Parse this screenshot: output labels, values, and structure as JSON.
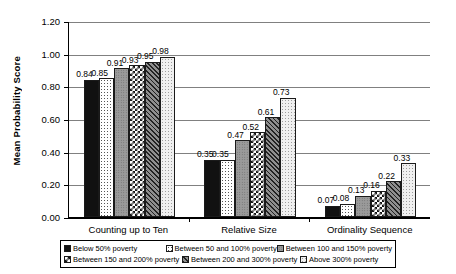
{
  "chart_data": {
    "type": "bar",
    "title": "",
    "xlabel": "",
    "ylabel": "Mean Probability Score",
    "ylim": [
      0.0,
      1.2
    ],
    "ytick_labels": [
      "0.00",
      "0.20",
      "0.40",
      "0.60",
      "0.80",
      "1.00",
      "1.20"
    ],
    "ytick_values": [
      0.0,
      0.2,
      0.4,
      0.6,
      0.8,
      1.0,
      1.2
    ],
    "grid": true,
    "legend_position": "bottom",
    "categories": [
      "Counting up to Ten",
      "Relative Size",
      "Ordinality Sequence"
    ],
    "series": [
      {
        "name": "Below 50% poverty",
        "pattern": "solid-black",
        "values": [
          0.84,
          0.35,
          0.07
        ],
        "labels": [
          "0.84",
          "0.35",
          "0.07"
        ]
      },
      {
        "name": "Between 50 and 100% poverty",
        "pattern": "light-dots",
        "values": [
          0.85,
          0.35,
          0.08
        ],
        "labels": [
          "0.85",
          "0.35",
          "0.08"
        ]
      },
      {
        "name": "Between 100 and 150% poverty",
        "pattern": "gray-dots",
        "values": [
          0.91,
          0.47,
          0.13
        ],
        "labels": [
          "0.91",
          "0.47",
          "0.13"
        ]
      },
      {
        "name": "Between 150 and 200% poverty",
        "pattern": "checkerboard",
        "values": [
          0.93,
          0.52,
          0.16
        ],
        "labels": [
          "0.93",
          "0.52",
          "0.16"
        ]
      },
      {
        "name": "Between 200 and 300% poverty",
        "pattern": "diagonal-hatch",
        "values": [
          0.95,
          0.61,
          0.22
        ],
        "labels": [
          "0.95",
          "0.61",
          "0.22"
        ]
      },
      {
        "name": "Above 300% poverty",
        "pattern": "pale-dots",
        "values": [
          0.98,
          0.73,
          0.33
        ],
        "labels": [
          "0.98",
          "0.73",
          "0.33"
        ]
      }
    ]
  },
  "axis": {
    "y_title": "Mean Probability Score"
  },
  "legend": {
    "items": [
      "Below 50% poverty",
      "Between 50 and 100% poverty",
      "Between 100 and 150% poverty",
      "Between 150 and 200% poverty",
      "Between 200 and 300% poverty",
      "Above 300% poverty"
    ]
  },
  "colors": {
    "axis": "#000000",
    "grid": "#808080",
    "bar_outline": "#1a1a1a",
    "background": "#ffffff"
  }
}
